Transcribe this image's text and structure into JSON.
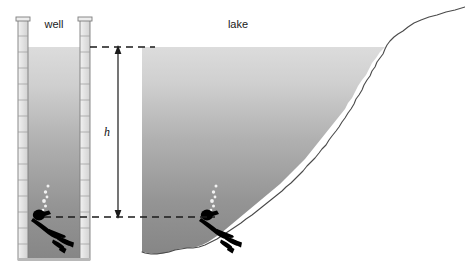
{
  "figure": {
    "title_alt": "Well and lake cross-section with diver at equal depth",
    "labels": {
      "well": "well",
      "lake": "lake",
      "height": "h"
    },
    "colors": {
      "water_surface": "#d9d9d9",
      "water_deep": "#868686",
      "wall_fill": "#e4e4e4",
      "wall_stroke": "#7a7a7a",
      "diver": "#000000",
      "dashed_line": "#1a1a1a",
      "arrow": "#1a1a1a",
      "shoreline": "#4a4a4a",
      "background": "#ffffff"
    },
    "geometry": {
      "water_surface_y": 47,
      "diver_depth_y": 217,
      "well_left_wall_x": 18,
      "well_right_wall_x": 88,
      "lake_left_x": 142,
      "arrow_x": 118
    }
  },
  "elements": {
    "well_label_position": "above well opening",
    "lake_label_position": "above lake surface",
    "height_label_position": "midpoint of vertical double arrow",
    "divers": [
      {
        "location": "well",
        "depth_marker": "on dashed depth line"
      },
      {
        "location": "lake",
        "depth_marker": "on dashed depth line"
      }
    ],
    "dashed_lines": [
      {
        "name": "surface-level-line",
        "y": 47
      },
      {
        "name": "depth-level-line",
        "y": 217
      }
    ]
  }
}
